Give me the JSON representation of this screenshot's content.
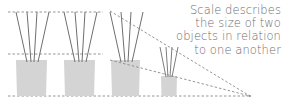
{
  "caption": {
    "lines": [
      "Scale describes",
      "the size of two",
      "objects in relation",
      "to one another"
    ]
  },
  "colors": {
    "vase": "#d4d4d4",
    "stick": "#6f6f6f",
    "dashed": "#8a8a8a",
    "text": "#6e6e6e",
    "background": "#ffffff"
  },
  "diagram": {
    "guides": [
      {
        "name": "top-guide",
        "y": 12
      },
      {
        "name": "middle-guide",
        "y": 54
      },
      {
        "name": "bottom-guide",
        "y": 96
      }
    ],
    "vases": [
      {
        "name": "vase-1",
        "size": "large"
      },
      {
        "name": "vase-2",
        "size": "large"
      },
      {
        "name": "vase-3",
        "size": "large-perspective"
      },
      {
        "name": "vase-4",
        "size": "small-perspective"
      }
    ],
    "vanishing_point": {
      "x": 250,
      "y": 96
    }
  }
}
